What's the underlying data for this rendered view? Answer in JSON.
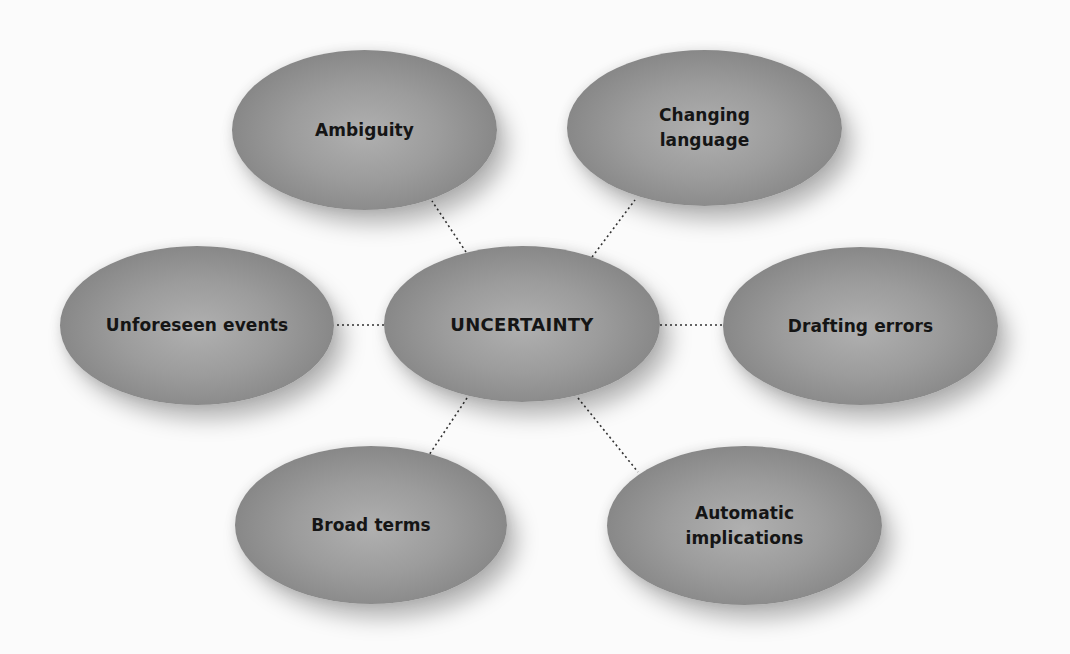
{
  "diagram": {
    "type": "hub-and-spoke mind map",
    "center": {
      "id": "uncertainty",
      "label": "UNCERTAINTY",
      "box": {
        "x": 384,
        "y": 246,
        "w": 276,
        "h": 156
      }
    },
    "nodes": [
      {
        "id": "ambiguity",
        "label": "Ambiguity",
        "box": {
          "x": 232,
          "y": 50,
          "w": 265,
          "h": 160
        }
      },
      {
        "id": "changing-language",
        "label": "Changing\nlanguage",
        "box": {
          "x": 567,
          "y": 50,
          "w": 275,
          "h": 156
        }
      },
      {
        "id": "unforeseen-events",
        "label": "Unforeseen events",
        "box": {
          "x": 60,
          "y": 246,
          "w": 274,
          "h": 159
        }
      },
      {
        "id": "drafting-errors",
        "label": "Drafting errors",
        "box": {
          "x": 723,
          "y": 247,
          "w": 275,
          "h": 158
        }
      },
      {
        "id": "broad-terms",
        "label": "Broad terms",
        "box": {
          "x": 235,
          "y": 446,
          "w": 272,
          "h": 158
        }
      },
      {
        "id": "automatic-implications",
        "label": "Automatic\nimplications",
        "box": {
          "x": 607,
          "y": 446,
          "w": 275,
          "h": 159
        }
      }
    ],
    "edges": [
      {
        "from": "uncertainty",
        "to": "ambiguity",
        "x1": 466,
        "y1": 252,
        "x2": 432,
        "y2": 201
      },
      {
        "from": "uncertainty",
        "to": "changing-language",
        "x1": 592,
        "y1": 257,
        "x2": 635,
        "y2": 200
      },
      {
        "from": "uncertainty",
        "to": "unforeseen-events",
        "x1": 384,
        "y1": 325,
        "x2": 334,
        "y2": 325
      },
      {
        "from": "uncertainty",
        "to": "drafting-errors",
        "x1": 660,
        "y1": 325,
        "x2": 723,
        "y2": 325
      },
      {
        "from": "uncertainty",
        "to": "broad-terms",
        "x1": 467,
        "y1": 398,
        "x2": 429,
        "y2": 455
      },
      {
        "from": "uncertainty",
        "to": "automatic-implications",
        "x1": 578,
        "y1": 398,
        "x2": 638,
        "y2": 472
      }
    ],
    "style": {
      "edge_color": "#333333",
      "edge_dash": "2 3",
      "node_fill_center": "#b0b0b0",
      "node_fill_edge": "#747474",
      "label_color": "#151515",
      "background": "#fbfbfb"
    }
  }
}
